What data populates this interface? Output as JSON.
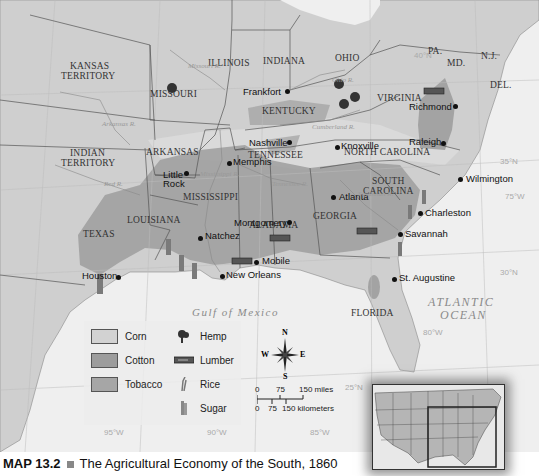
{
  "caption": {
    "map_number": "MAP 13.2",
    "title": "The Agricultural Economy of the South, 1860"
  },
  "states": [
    {
      "name": "KANSAS",
      "line2": "TERRITORY",
      "x": 88,
      "y": 67
    },
    {
      "name": "MISSOURI",
      "x": 174,
      "y": 95
    },
    {
      "name": "ILLINOIS",
      "x": 232,
      "y": 64
    },
    {
      "name": "INDIANA",
      "x": 284,
      "y": 62
    },
    {
      "name": "OHIO",
      "x": 347,
      "y": 59
    },
    {
      "name": "PA.",
      "x": 437,
      "y": 52
    },
    {
      "name": "MD.",
      "x": 456,
      "y": 64
    },
    {
      "name": "N.J.",
      "x": 493,
      "y": 57
    },
    {
      "name": "DEL.",
      "x": 502,
      "y": 86
    },
    {
      "name": "KENTUCKY",
      "x": 286,
      "y": 112
    },
    {
      "name": "VIRGINIA",
      "x": 401,
      "y": 99
    },
    {
      "name": "INDIAN",
      "line2": "TERRITORY",
      "x": 88,
      "y": 154
    },
    {
      "name": "ARKANSAS",
      "x": 170,
      "y": 153
    },
    {
      "name": "TENNESSEE",
      "x": 275,
      "y": 156
    },
    {
      "name": "NORTH CAROLINA",
      "x": 386,
      "y": 153
    },
    {
      "name": "MISSISSIPPI",
      "x": 216,
      "y": 198
    },
    {
      "name": "ALABAMA",
      "x": 270,
      "y": 226
    },
    {
      "name": "SOUTH",
      "line2": "CAROLINA",
      "x": 387,
      "y": 182
    },
    {
      "name": "GEORGIA",
      "x": 334,
      "y": 217
    },
    {
      "name": "LOUISIANA",
      "x": 154,
      "y": 221
    },
    {
      "name": "TEXAS",
      "x": 98,
      "y": 235
    },
    {
      "name": "FLORIDA",
      "x": 372,
      "y": 314
    }
  ],
  "cities": [
    {
      "name": "Frankfort",
      "x": 283,
      "y": 93,
      "dx": 45,
      "dy": 98,
      "anchor": "left"
    },
    {
      "name": "Richmond",
      "x": 420,
      "y": 107,
      "dx": 458,
      "dy": 106
    },
    {
      "name": "Nashville",
      "x": 250,
      "y": 140,
      "dx": 291,
      "dy": 143,
      "anchor": "left"
    },
    {
      "name": "Knoxville",
      "x": 340,
      "y": 142,
      "dx": 337,
      "dy": 147
    },
    {
      "name": "Raleigh",
      "x": 418,
      "y": 137,
      "dx": 444,
      "dy": 143,
      "anchor": "left"
    },
    {
      "name": "Memphis",
      "x": 232,
      "y": 156,
      "dx": 228,
      "dy": 163
    },
    {
      "name": "Little",
      "line2": "Rock",
      "x": 166,
      "y": 173,
      "dx": 187,
      "dy": 173
    },
    {
      "name": "Wilmington",
      "x": 460,
      "y": 179,
      "dx": 458,
      "dy": 179
    },
    {
      "name": "Atlanta",
      "x": 336,
      "y": 197,
      "dx": 332,
      "dy": 197
    },
    {
      "name": "Charleston",
      "x": 423,
      "y": 215,
      "dx": 419,
      "dy": 213
    },
    {
      "name": "Montgomery",
      "x": 238,
      "y": 219,
      "dx": 289,
      "dy": 222,
      "anchor": "left"
    },
    {
      "name": "Natchez",
      "x": 205,
      "y": 233,
      "dx": 200,
      "dy": 239
    },
    {
      "name": "Savannah",
      "x": 402,
      "y": 232,
      "dx": 399,
      "dy": 234
    },
    {
      "name": "Mobile",
      "x": 261,
      "y": 255,
      "dx": 257,
      "dy": 262
    },
    {
      "name": "New Orleans",
      "x": 226,
      "y": 272,
      "dx": 222,
      "dy": 276
    },
    {
      "name": "Houston",
      "x": 84,
      "y": 270,
      "dx": 119,
      "dy": 277,
      "anchor": "left"
    },
    {
      "name": "St. Augustine",
      "x": 398,
      "y": 276,
      "dx": 394,
      "dy": 279
    }
  ],
  "rivers": [
    {
      "name": "Missouri R.",
      "x": 188,
      "y": 62
    },
    {
      "name": "Ohio R.",
      "x": 332,
      "y": 76
    },
    {
      "name": "Cumberland R.",
      "x": 312,
      "y": 123
    },
    {
      "name": "Arkansas R.",
      "x": 102,
      "y": 120
    },
    {
      "name": "Red R.",
      "x": 104,
      "y": 180
    },
    {
      "name": "Mississippi R.",
      "x": 200,
      "y": 170
    },
    {
      "name": "Tennessee R.",
      "x": 272,
      "y": 180
    },
    {
      "name": "Savannah R.",
      "x": 358,
      "y": 190
    }
  ],
  "water_bodies": [
    {
      "name": "Gulf of Mexico",
      "x": 192,
      "y": 306,
      "size": 11
    },
    {
      "name": "ATLANTIC",
      "x": 428,
      "y": 295,
      "size": 12
    },
    {
      "name": "OCEAN",
      "x": 440,
      "y": 308,
      "size": 12
    }
  ],
  "gridlines": [
    {
      "label": "40°N",
      "x": 414,
      "y": 51
    },
    {
      "label": "35°N",
      "x": 500,
      "y": 157
    },
    {
      "label": "75°W",
      "x": 505,
      "y": 192
    },
    {
      "label": "30°N",
      "x": 500,
      "y": 268
    },
    {
      "label": "80°W",
      "x": 423,
      "y": 328
    },
    {
      "label": "25°N",
      "x": 345,
      "y": 383
    },
    {
      "label": "95°W",
      "x": 104,
      "y": 428
    },
    {
      "label": "90°W",
      "x": 207,
      "y": 428
    },
    {
      "label": "85°W",
      "x": 310,
      "y": 428
    }
  ],
  "legend": {
    "regions": [
      {
        "label": "Corn",
        "color": "#d2d2d2"
      },
      {
        "label": "Cotton",
        "color": "#9c9c9c"
      },
      {
        "label": "Tobacco",
        "color": "#a6a6a6"
      }
    ],
    "symbols": [
      {
        "label": "Hemp",
        "icon": "hemp-icon"
      },
      {
        "label": "Lumber",
        "icon": "lumber-icon"
      },
      {
        "label": "Rice",
        "icon": "rice-icon"
      },
      {
        "label": "Sugar",
        "icon": "sugar-icon"
      }
    ]
  },
  "compass": {
    "n": "N",
    "s": "S",
    "e": "E",
    "w": "W"
  },
  "scale": {
    "miles": [
      "0",
      "75",
      "150 miles"
    ],
    "km": [
      "0",
      "75",
      "150 kilometers"
    ]
  },
  "colors": {
    "land": "#cfcfcf",
    "water": "#efefef",
    "corn": "#d8d8d8",
    "cotton": "#9e9e9e",
    "tobacco": "#a8a8a8"
  }
}
